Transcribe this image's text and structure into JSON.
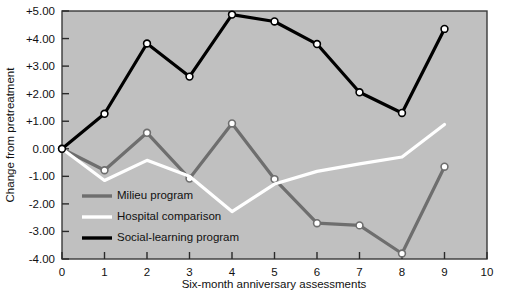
{
  "chart_data": {
    "type": "line",
    "title": "",
    "xlabel": "Six-month anniversary assessments",
    "ylabel": "Change from pretreatment",
    "xlim": [
      0,
      10
    ],
    "ylim": [
      -4.0,
      5.0
    ],
    "grid": false,
    "legend_position": "inside-lower-left",
    "background_color": "#c0c0c0",
    "plot_border_color": "#333333",
    "x": [
      0,
      1,
      2,
      3,
      4,
      5,
      6,
      7,
      8,
      9
    ],
    "xticks": [
      "0",
      "1",
      "2",
      "3",
      "4",
      "5",
      "6",
      "7",
      "8",
      "9",
      "10"
    ],
    "xtick_values": [
      0,
      1,
      2,
      3,
      4,
      5,
      6,
      7,
      8,
      9,
      10
    ],
    "yticks": [
      "+5.00",
      "+4.00",
      "+3.00",
      "+2.00",
      "+1.00",
      "0.00",
      "-1.00",
      "-2.00",
      "-3.00",
      "-4.00"
    ],
    "ytick_values": [
      5,
      4,
      3,
      2,
      1,
      0,
      -1,
      -2,
      -3,
      -4
    ],
    "series": [
      {
        "name": "Milieu program",
        "color": "#6e6e6e",
        "marker": "open-circle",
        "values": [
          0.0,
          -0.78,
          0.58,
          -1.08,
          0.92,
          -1.1,
          -2.7,
          -2.78,
          -3.8,
          -0.65
        ]
      },
      {
        "name": "Hospital comparison",
        "color": "#ffffff",
        "marker": "none",
        "values": [
          0.0,
          -1.15,
          -0.42,
          -1.0,
          -2.28,
          -1.28,
          -0.82,
          -0.55,
          -0.3,
          0.88
        ]
      },
      {
        "name": "Social-learning program",
        "color": "#000000",
        "marker": "open-circle",
        "values": [
          0.0,
          1.27,
          3.82,
          2.62,
          4.87,
          4.62,
          3.8,
          2.05,
          1.3,
          4.35
        ]
      }
    ]
  },
  "legend": {
    "entries": [
      {
        "label": "Milieu program",
        "color": "#6e6e6e"
      },
      {
        "label": "Hospital comparison",
        "color": "#ffffff"
      },
      {
        "label": "Social-learning program",
        "color": "#000000"
      }
    ]
  }
}
